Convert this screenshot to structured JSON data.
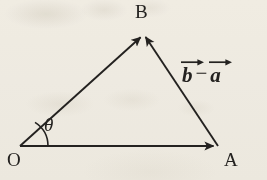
{
  "figure": {
    "kind": "vector-triangle-diagram",
    "background_color": "#f7f5f0",
    "ink_color": "#242220",
    "width": 267,
    "height": 180
  },
  "labels": {
    "origin": "O",
    "point_a": "A",
    "point_b": "B",
    "angle": "θ"
  },
  "expression": {
    "left_term": "b",
    "operator": "−",
    "right_term": "a",
    "full_text": "b⃗ − a⃗"
  },
  "geometry": {
    "vertices": {
      "O": {
        "x": 20,
        "y": 146
      },
      "A": {
        "x": 218,
        "y": 146
      },
      "B": {
        "x": 143,
        "y": 33
      }
    },
    "vectors": [
      {
        "name": "OA",
        "from": "O",
        "to": "A",
        "arrowhead_at": "A"
      },
      {
        "name": "OB",
        "from": "O",
        "to": "B",
        "arrowhead_at": "B"
      },
      {
        "name": "AB",
        "from": "A",
        "to": "B",
        "arrowhead_at": "B"
      }
    ],
    "angle_arc": {
      "at": "O",
      "radius": 28,
      "label": "θ"
    }
  }
}
